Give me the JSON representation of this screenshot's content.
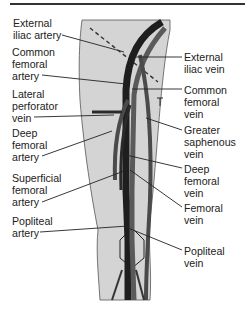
{
  "diagram": {
    "colors": {
      "skin": "#d4d4d4",
      "vein": "#1e1e1e",
      "artery": "#5a5a5a",
      "leader": "#222222",
      "text": "#222222"
    },
    "left_labels": [
      {
        "id": "external-iliac-artery",
        "text": "External\niliac artery"
      },
      {
        "id": "common-femoral-artery",
        "text": "Common\nfemoral\nartery"
      },
      {
        "id": "lateral-perforator-vein",
        "text": "Lateral\nperforator\nvein"
      },
      {
        "id": "deep-femoral-artery",
        "text": "Deep\nfemoral\nartery"
      },
      {
        "id": "superficial-femoral-artery",
        "text": "Superficial\nfemoral\nartery"
      },
      {
        "id": "popliteal-artery",
        "text": "Popliteal\nartery"
      }
    ],
    "right_labels": [
      {
        "id": "external-iliac-vein",
        "text": "External\niliac vein"
      },
      {
        "id": "common-femoral-vein",
        "text": "Common\nfemoral\nvein"
      },
      {
        "id": "greater-saphenous-vein",
        "text": "Greater\nsaphenous\nvein"
      },
      {
        "id": "deep-femoral-vein",
        "text": "Deep\nfemoral\nvein"
      },
      {
        "id": "femoral-vein",
        "text": "Femoral\nvein"
      },
      {
        "id": "popliteal-vein",
        "text": "Popliteal\nvein"
      }
    ]
  }
}
